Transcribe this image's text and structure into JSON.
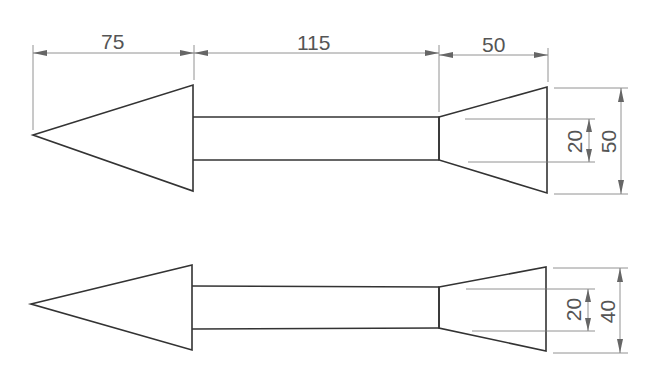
{
  "diagram": {
    "title": "",
    "top_figure": {
      "horizontal_dims": [
        {
          "label": "75"
        },
        {
          "label": "115"
        },
        {
          "label": "50"
        }
      ],
      "vertical_dims": [
        {
          "label": "20"
        },
        {
          "label": "50"
        }
      ]
    },
    "bottom_figure": {
      "vertical_dims": [
        {
          "label": "20"
        },
        {
          "label": "40"
        }
      ]
    }
  }
}
